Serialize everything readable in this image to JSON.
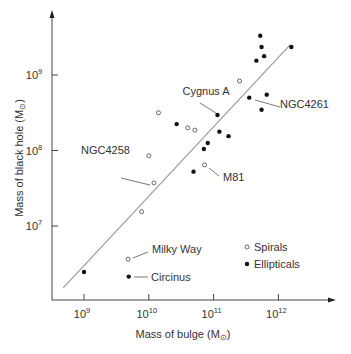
{
  "chart_data": {
    "type": "scatter",
    "title": "",
    "xlabel": "Mass of bulge (M☉)",
    "ylabel": "Mass of black hole (M☉)",
    "xscale": "log",
    "yscale": "log",
    "xlim_log10": [
      8.5,
      12.85
    ],
    "ylim_log10": [
      6.05,
      9.85
    ],
    "x_ticks": [
      {
        "exp": "9",
        "log": 9
      },
      {
        "exp": "10",
        "log": 10
      },
      {
        "exp": "11",
        "log": 11
      },
      {
        "exp": "12",
        "log": 12
      }
    ],
    "y_ticks": [
      {
        "exp": "7",
        "log": 7
      },
      {
        "exp": "8",
        "log": 8
      },
      {
        "exp": "9",
        "log": 9
      }
    ],
    "tick_base": "10",
    "grid": false,
    "legend": {
      "position": "lower right",
      "entries": [
        {
          "label": "Spirals",
          "marker": "open-circle"
        },
        {
          "label": "Ellipticals",
          "marker": "filled-circle"
        }
      ]
    },
    "series": [
      {
        "name": "Spirals",
        "marker": "open-circle",
        "points": [
          {
            "log_x": 9.68,
            "log_y": 6.56,
            "label": "Milky Way"
          },
          {
            "log_x": 9.89,
            "log_y": 7.19
          },
          {
            "log_x": 10.08,
            "log_y": 7.57,
            "label": "NGC4258"
          },
          {
            "log_x": 10.0,
            "log_y": 7.93
          },
          {
            "log_x": 10.15,
            "log_y": 8.5
          },
          {
            "log_x": 10.6,
            "log_y": 8.3
          },
          {
            "log_x": 10.71,
            "log_y": 8.27
          },
          {
            "log_x": 10.86,
            "log_y": 7.81,
            "label": "M81"
          },
          {
            "log_x": 11.4,
            "log_y": 8.92
          }
        ]
      },
      {
        "name": "Ellipticals",
        "marker": "filled-circle",
        "points": [
          {
            "log_x": 9.0,
            "log_y": 6.39
          },
          {
            "log_x": 9.69,
            "log_y": 6.33,
            "label": "Circinus"
          },
          {
            "log_x": 10.43,
            "log_y": 8.35
          },
          {
            "log_x": 11.06,
            "log_y": 8.47,
            "label": "Cygnus A"
          },
          {
            "log_x": 11.09,
            "log_y": 8.25
          },
          {
            "log_x": 11.23,
            "log_y": 8.19
          },
          {
            "log_x": 10.91,
            "log_y": 8.1
          },
          {
            "log_x": 10.85,
            "log_y": 8.02
          },
          {
            "log_x": 10.69,
            "log_y": 7.72
          },
          {
            "log_x": 11.55,
            "log_y": 8.7,
            "label": "NGC4261"
          },
          {
            "log_x": 11.82,
            "log_y": 8.74
          },
          {
            "log_x": 11.74,
            "log_y": 8.54
          },
          {
            "log_x": 11.72,
            "log_y": 9.52
          },
          {
            "log_x": 11.74,
            "log_y": 9.37
          },
          {
            "log_x": 11.78,
            "log_y": 9.25
          },
          {
            "log_x": 11.66,
            "log_y": 9.19
          },
          {
            "log_x": 12.2,
            "log_y": 9.37
          }
        ]
      }
    ],
    "fit_line": {
      "from": {
        "log_x": 8.68,
        "log_y": 6.18
      },
      "to": {
        "log_x": 12.18,
        "log_y": 9.4
      }
    },
    "annotations": [
      {
        "text": "Cygnus A",
        "text_x": 206,
        "text_y": 95,
        "line": [
          200,
          103,
          216,
          113
        ]
      },
      {
        "text": "NGC4261",
        "text_x": 280,
        "text_y": 108,
        "line": [
          255,
          100,
          280,
          107
        ]
      },
      {
        "text": "NGC4258",
        "text_x": 81,
        "text_y": 154,
        "line": [
          121,
          178,
          150,
          185
        ]
      },
      {
        "text": "M81",
        "text_x": 223,
        "text_y": 181,
        "line": [
          209,
          168,
          219,
          176
        ]
      },
      {
        "text": "Milky Way",
        "text_x": 152,
        "text_y": 253,
        "line": [
          133,
          258,
          148,
          252
        ]
      }
    ]
  },
  "labels": {
    "y_axis": "Mass of black hole (M",
    "x_axis": "Mass of bulge (M",
    "sun_symbol": "⊙",
    "close_paren": ")",
    "circinus": "Circinus",
    "legend_spirals": "Spirals",
    "legend_ellipticals": "Ellipticals"
  }
}
